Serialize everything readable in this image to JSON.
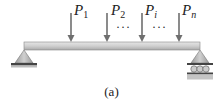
{
  "figure": {
    "caption": "(a)",
    "loads": [
      {
        "symbol": "P",
        "subscript": "1"
      },
      {
        "symbol": "P",
        "subscript": "2"
      },
      {
        "symbol": "P",
        "subscript": "i"
      },
      {
        "symbol": "P",
        "subscript": "n"
      }
    ],
    "ellipsis": "···",
    "left_support": "pin",
    "right_support": "roller",
    "colors": {
      "beam": "#c8c8c8",
      "support": "#b4b4b4",
      "arrow": "#707070",
      "ground": "#555555"
    }
  }
}
